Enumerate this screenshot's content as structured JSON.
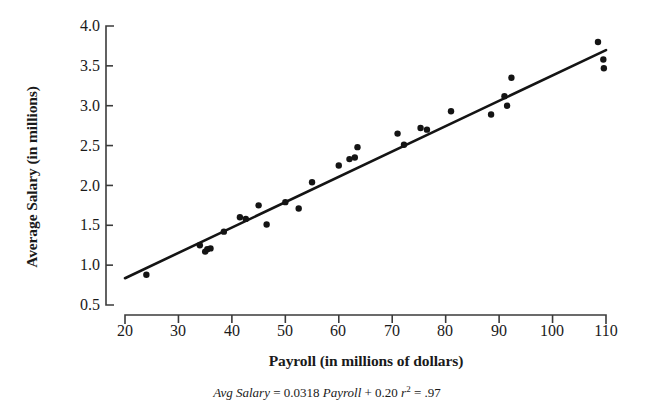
{
  "chart_data": {
    "type": "scatter",
    "title": "",
    "xlabel": "Payroll (in millions of dollars)",
    "ylabel": "Average Salary (in millions)",
    "xlim": [
      20,
      110
    ],
    "ylim": [
      0.5,
      4.0
    ],
    "xticks": [
      20,
      30,
      40,
      50,
      60,
      70,
      80,
      90,
      100,
      110
    ],
    "yticks": [
      "0.5",
      "1.0",
      "1.5",
      "2.0",
      "2.5",
      "3.0",
      "3.5",
      "4.0"
    ],
    "grid": false,
    "legend": false,
    "series": [
      {
        "name": "Teams",
        "marker": "filled-circle",
        "color": "#141414",
        "points": [
          [
            24.0,
            0.88
          ],
          [
            34.0,
            1.25
          ],
          [
            35.0,
            1.17
          ],
          [
            35.4,
            1.2
          ],
          [
            36.0,
            1.21
          ],
          [
            38.5,
            1.42
          ],
          [
            41.5,
            1.6
          ],
          [
            42.6,
            1.58
          ],
          [
            45.0,
            1.75
          ],
          [
            46.5,
            1.51
          ],
          [
            50.0,
            1.79
          ],
          [
            52.5,
            1.71
          ],
          [
            55.0,
            2.04
          ],
          [
            60.0,
            2.25
          ],
          [
            62.0,
            2.33
          ],
          [
            63.0,
            2.35
          ],
          [
            63.5,
            2.48
          ],
          [
            71.0,
            2.65
          ],
          [
            72.2,
            2.51
          ],
          [
            75.3,
            2.72
          ],
          [
            76.5,
            2.7
          ],
          [
            81.0,
            2.93
          ],
          [
            88.5,
            2.89
          ],
          [
            91.0,
            3.12
          ],
          [
            91.5,
            3.0
          ],
          [
            92.3,
            3.35
          ],
          [
            108.5,
            3.8
          ],
          [
            109.5,
            3.58
          ],
          [
            109.6,
            3.47
          ]
        ]
      }
    ],
    "fit_line": {
      "slope": 0.0318,
      "intercept": 0.2,
      "r_squared": 0.97,
      "x_start": 20.0,
      "x_end": 110.0,
      "color": "#141414"
    },
    "annotations": [
      {
        "name": "regression-equation",
        "text": "Avg Salary = 0.0318 Payroll + 0.20 r2 = .97"
      }
    ]
  },
  "caption": {
    "lhs": "Avg Salary",
    "eq1": " = ",
    "slope": "0.0318",
    "var": " Payroll",
    "plus": " + ",
    "intercept": "0.20",
    "r": " r",
    "sup": "2",
    "eq2": " = ",
    "rsq": ".97"
  },
  "axes": {
    "x_title": "Payroll (in millions of dollars)",
    "y_title": "Average Salary (in millions)",
    "x_tick_labels": [
      "20",
      "30",
      "40",
      "50",
      "60",
      "70",
      "80",
      "90",
      "100",
      "110"
    ],
    "y_tick_labels": [
      "4.0",
      "3.5",
      "3.0",
      "2.5",
      "2.0",
      "1.5",
      "1.0",
      "0.5"
    ]
  },
  "colors": {
    "ink": "#141414",
    "axis": "#3b3b3b",
    "background": "#ffffff"
  }
}
